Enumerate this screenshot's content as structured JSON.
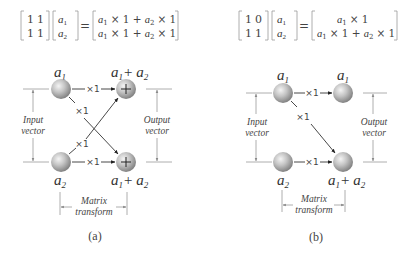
{
  "panels": [
    {
      "caption": "(a)",
      "equation": {
        "matrix": [
          [
            "1",
            "1"
          ],
          [
            "1",
            "1"
          ]
        ],
        "vector": [
          "a1",
          "a2"
        ],
        "result": [
          "a1 × 1 + a2 × 1",
          "a1 × 1 + a2 × 1"
        ]
      },
      "inputs": [
        "a1",
        "a2"
      ],
      "outputs": [
        "a1+ a2",
        "a1+ a2"
      ],
      "output_nodes_have_plus": true,
      "edges": [
        {
          "from": "in1",
          "to": "out1",
          "weight": "×1"
        },
        {
          "from": "in1",
          "to": "out2",
          "weight": "×1"
        },
        {
          "from": "in2",
          "to": "out1",
          "weight": "×1"
        },
        {
          "from": "in2",
          "to": "out2",
          "weight": "×1"
        }
      ],
      "labels": {
        "input": [
          "Input",
          "vector"
        ],
        "output": [
          "Output",
          "vector"
        ],
        "transform": [
          "Matrix",
          "transform"
        ]
      }
    },
    {
      "caption": "(b)",
      "equation": {
        "matrix": [
          [
            "1",
            "0"
          ],
          [
            "1",
            "1"
          ]
        ],
        "vector": [
          "a1",
          "a2"
        ],
        "result": [
          "a1 × 1",
          "a1 × 1 + a2 × 1"
        ]
      },
      "inputs": [
        "a1",
        "a2"
      ],
      "outputs": [
        "a1",
        "a1+ a2"
      ],
      "output_nodes_have_plus": false,
      "edges": [
        {
          "from": "in1",
          "to": "out1",
          "weight": "×1"
        },
        {
          "from": "in1",
          "to": "out2",
          "weight": "×1"
        },
        {
          "from": "in2",
          "to": "out2",
          "weight": "×1"
        }
      ],
      "labels": {
        "input": [
          "Input",
          "vector"
        ],
        "output": [
          "Output",
          "vector"
        ],
        "transform": [
          "Matrix",
          "transform"
        ]
      }
    }
  ],
  "text": {
    "a": "a",
    "sub1": "1",
    "sub2": "2",
    "plus": "+",
    "times1": "×1",
    "eq": "=",
    "m_a_11": "1",
    "m_a_12": "1",
    "m_a_21": "1",
    "m_a_22": "1",
    "m_b_11": "1",
    "m_b_12": "0",
    "m_b_21": "1",
    "m_b_22": "1",
    "res_times": "× 1 +",
    "res_times_end": "× 1",
    "input": "Input",
    "output": "Output",
    "vector": "vector",
    "matrix": "Matrix",
    "transform": "transform",
    "cap_a": "(a)",
    "cap_b": "(b)"
  }
}
